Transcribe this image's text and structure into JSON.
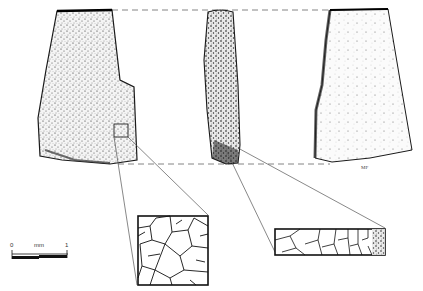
{
  "figure": {
    "views": [
      {
        "id": "front",
        "label": "front face"
      },
      {
        "id": "side",
        "label": "side profile"
      },
      {
        "id": "back",
        "label": "back face"
      }
    ],
    "insets": [
      {
        "id": "texture-face",
        "label": "surface texture detail"
      },
      {
        "id": "texture-section",
        "label": "cross-section texture detail"
      }
    ],
    "scale_bar": {
      "start": "0",
      "unit": "mm",
      "end": "1"
    },
    "artist_initials": "MF",
    "colors": {
      "ink": "#1a1a1a",
      "background": "#ffffff",
      "guide": "#555555"
    }
  }
}
